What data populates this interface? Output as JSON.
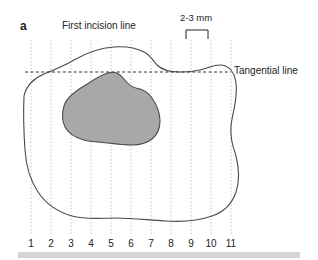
{
  "figure": {
    "panel_letter": "a",
    "type": "anatomical-diagram",
    "labels": {
      "first_incision_line": "First incision line",
      "tangential_line": "Tangential line",
      "measurement": "2-3 mm"
    },
    "axis": {
      "tick_labels": [
        "1",
        "2",
        "3",
        "4",
        "5",
        "6",
        "7",
        "8",
        "9",
        "10",
        "11"
      ],
      "tick_x": [
        31,
        51,
        71,
        91,
        111,
        131,
        151,
        171,
        191,
        211,
        231
      ]
    },
    "colors": {
      "lesion_fill": "#a8a8a8",
      "lesion_stroke": "#4a4a4a",
      "outline_stroke": "#4a4a4a",
      "gridline": "#c8c8c8",
      "dashed_line": "#333333",
      "bottom_bar": "#d4d4d4",
      "text": "#222222"
    },
    "geometry": {
      "gridline_top": 40,
      "gridline_bottom": 236,
      "tangential_line_y": 72,
      "tangential_line_x_start": 25,
      "tangential_line_x_end": 231,
      "bracket_x_start": 186,
      "bracket_x_end": 208,
      "bracket_y": 30
    }
  }
}
